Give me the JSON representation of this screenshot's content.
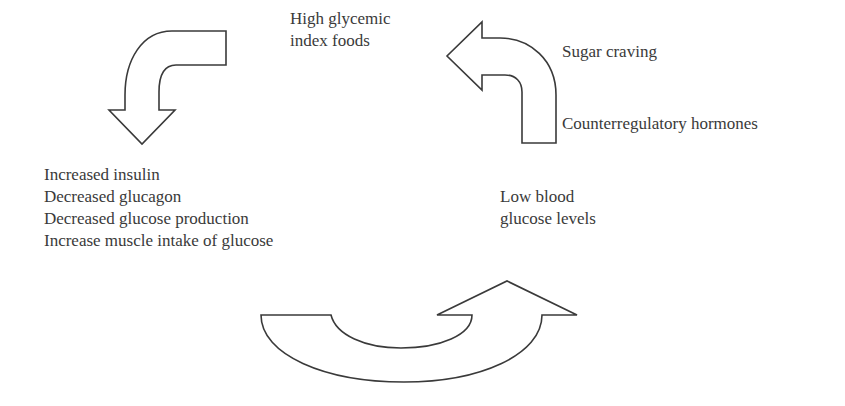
{
  "diagram": {
    "type": "cycle",
    "nodes": {
      "high_gi_foods": {
        "lines": [
          "High glycemic",
          "index foods"
        ]
      },
      "insulin_response": {
        "lines": [
          "Increased insulin",
          "Decreased glucagon",
          "Decreased glucose production",
          "Increase muscle intake of glucose"
        ]
      },
      "low_blood_glucose": {
        "lines": [
          "Low blood",
          "glucose levels"
        ]
      },
      "sugar_craving": {
        "label": "Sugar craving"
      },
      "counterregulatory": {
        "label": "Counterregulatory hormones"
      }
    },
    "arrows": [
      {
        "id": "arrow-foods-to-insulin",
        "from": "high_gi_foods",
        "to": "insulin_response",
        "shape": "curved-down-left"
      },
      {
        "id": "arrow-insulin-to-low-glucose",
        "from": "insulin_response",
        "to": "low_blood_glucose",
        "shape": "u-turn-up-right"
      },
      {
        "id": "arrow-low-glucose-to-foods",
        "from": "low_blood_glucose",
        "to": "high_gi_foods",
        "shape": "curved-up-left"
      }
    ],
    "colors": {
      "stroke": "#3a3a3a",
      "fill": "#ffffff",
      "text": "#3a3a3a"
    }
  }
}
